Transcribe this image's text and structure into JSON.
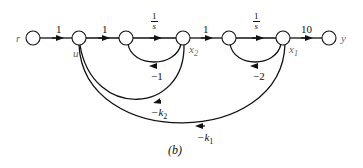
{
  "diagram": {
    "type": "signal-flow-graph",
    "caption": "(b)",
    "nodes": [
      {
        "id": "r",
        "label": "r"
      },
      {
        "id": "u",
        "label": "u"
      },
      {
        "id": "n3",
        "label": ""
      },
      {
        "id": "x2",
        "label": "x",
        "sub": "2"
      },
      {
        "id": "n5",
        "label": ""
      },
      {
        "id": "x1",
        "label": "x",
        "sub": "1"
      },
      {
        "id": "y",
        "label": "y"
      }
    ],
    "forward_branches": [
      {
        "from": "r",
        "to": "u",
        "gain": "1"
      },
      {
        "from": "u",
        "to": "n3",
        "gain": "1"
      },
      {
        "from": "n3",
        "to": "x2",
        "gain_num": "1",
        "gain_den": "s"
      },
      {
        "from": "x2",
        "to": "n5",
        "gain": "1"
      },
      {
        "from": "n5",
        "to": "x1",
        "gain_num": "1",
        "gain_den": "s"
      },
      {
        "from": "x1",
        "to": "y",
        "gain": "10"
      }
    ],
    "feedback_branches": [
      {
        "from": "x2",
        "to": "n3",
        "gain": "−1"
      },
      {
        "from": "x1",
        "to": "n5",
        "gain": "−2"
      },
      {
        "from": "x2",
        "to": "u",
        "gain": "−k",
        "sub": "2"
      },
      {
        "from": "x1",
        "to": "u",
        "gain": "−k",
        "sub": "1"
      }
    ]
  }
}
